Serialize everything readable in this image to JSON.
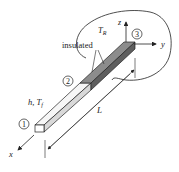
{
  "diagram": {
    "type": "fin-heat-transfer-schematic",
    "labels": {
      "node1": "1",
      "node2": "2",
      "node3": "3",
      "convection": "h, T",
      "convection_sub": "f",
      "radiation": "T",
      "radiation_sub": "R",
      "insulated": "insulated",
      "length": "L",
      "axis_x": "x",
      "axis_y": "y",
      "axis_z": "z"
    },
    "colors": {
      "line": "#222222",
      "fin_light": "#f4f4f4",
      "fin_light_side": "#d9d9d9",
      "fin_dark_top": "#8c8c8c",
      "fin_dark_side": "#5e5e5e"
    }
  }
}
